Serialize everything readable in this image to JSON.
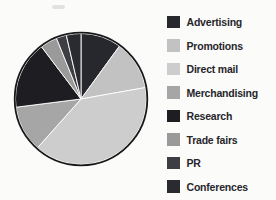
{
  "chart_data": {
    "type": "pie",
    "title": "",
    "categories": [
      "Advertising",
      "Promotions",
      "Direct mail",
      "Merchandising",
      "Research",
      "Trade fairs",
      "PR",
      "Conferences"
    ],
    "values": [
      10.0,
      12.2,
      39.4,
      11.4,
      16.7,
      4.2,
      2.5,
      3.6
    ],
    "unit": "percent",
    "start_angle_deg": 0,
    "direction": "clockwise",
    "colors": [
      "#27272e",
      "#c2c2c3",
      "#cdcdcd",
      "#a6a6a7",
      "#1d1d22",
      "#9a9a9b",
      "#3d3d44",
      "#2a2a31"
    ],
    "legend_position": "right",
    "slice_separator_color": "#ffffff",
    "outline_color": "#18181b",
    "grid": "off"
  }
}
